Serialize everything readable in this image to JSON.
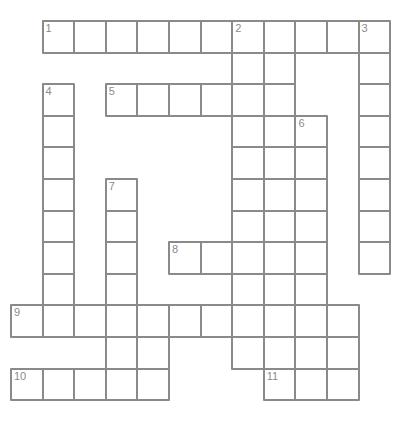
{
  "puzzle": {
    "title": "Crossword puzzle grid",
    "grid": {
      "origin_x": 10,
      "origin_y": 20,
      "cell_size": 31.6,
      "columns": 12,
      "rows": 12,
      "cell_border_color": "#8a8a8a",
      "cell_fill_color": "#ffffff",
      "number_color": "#8a8a8a",
      "background_color": "#ffffff"
    },
    "entries": [
      {
        "number": "1",
        "direction": "across",
        "row": 0,
        "col": 1,
        "length": 11
      },
      {
        "number": "2",
        "direction": "down",
        "row": 0,
        "col": 7,
        "length": 11
      },
      {
        "number": "3",
        "direction": "down",
        "row": 0,
        "col": 11,
        "length": 8
      },
      {
        "number": "4",
        "direction": "down",
        "row": 2,
        "col": 1,
        "length": 8
      },
      {
        "number": "5",
        "direction": "across",
        "row": 2,
        "col": 3,
        "length": 5
      },
      {
        "number": "6",
        "direction": "down",
        "row": 3,
        "col": 9,
        "length": 8
      },
      {
        "number": "7",
        "direction": "down",
        "row": 5,
        "col": 3,
        "length": 6
      },
      {
        "number": "8",
        "direction": "across",
        "row": 7,
        "col": 5,
        "length": 3
      },
      {
        "number": "9",
        "direction": "across",
        "row": 9,
        "col": 0,
        "length": 11
      },
      {
        "number": "10",
        "direction": "across",
        "row": 11,
        "col": 0,
        "length": 5
      },
      {
        "number": "11",
        "direction": "across",
        "row": 11,
        "col": 8,
        "length": 3
      }
    ],
    "cells": [
      {
        "row": 0,
        "col": 1,
        "number": "1",
        "letter": ""
      },
      {
        "row": 0,
        "col": 2,
        "number": "",
        "letter": ""
      },
      {
        "row": 0,
        "col": 3,
        "number": "",
        "letter": ""
      },
      {
        "row": 0,
        "col": 4,
        "number": "",
        "letter": ""
      },
      {
        "row": 0,
        "col": 5,
        "number": "",
        "letter": ""
      },
      {
        "row": 0,
        "col": 6,
        "number": "",
        "letter": ""
      },
      {
        "row": 0,
        "col": 7,
        "number": "2",
        "letter": ""
      },
      {
        "row": 0,
        "col": 8,
        "number": "",
        "letter": ""
      },
      {
        "row": 0,
        "col": 9,
        "number": "",
        "letter": ""
      },
      {
        "row": 0,
        "col": 10,
        "number": "",
        "letter": ""
      },
      {
        "row": 0,
        "col": 11,
        "number": "3",
        "letter": ""
      },
      {
        "row": 1,
        "col": 7,
        "number": "",
        "letter": ""
      },
      {
        "row": 1,
        "col": 8,
        "number": "",
        "letter": ""
      },
      {
        "row": 1,
        "col": 11,
        "number": "",
        "letter": ""
      },
      {
        "row": 2,
        "col": 1,
        "number": "4",
        "letter": ""
      },
      {
        "row": 2,
        "col": 3,
        "number": "5",
        "letter": ""
      },
      {
        "row": 2,
        "col": 4,
        "number": "",
        "letter": ""
      },
      {
        "row": 2,
        "col": 5,
        "number": "",
        "letter": ""
      },
      {
        "row": 2,
        "col": 6,
        "number": "",
        "letter": ""
      },
      {
        "row": 2,
        "col": 7,
        "number": "",
        "letter": ""
      },
      {
        "row": 2,
        "col": 8,
        "number": "",
        "letter": ""
      },
      {
        "row": 2,
        "col": 11,
        "number": "",
        "letter": ""
      },
      {
        "row": 3,
        "col": 1,
        "number": "",
        "letter": ""
      },
      {
        "row": 3,
        "col": 7,
        "number": "",
        "letter": ""
      },
      {
        "row": 3,
        "col": 8,
        "number": "",
        "letter": ""
      },
      {
        "row": 3,
        "col": 9,
        "number": "6",
        "letter": ""
      },
      {
        "row": 3,
        "col": 11,
        "number": "",
        "letter": ""
      },
      {
        "row": 4,
        "col": 1,
        "number": "",
        "letter": ""
      },
      {
        "row": 4,
        "col": 7,
        "number": "",
        "letter": ""
      },
      {
        "row": 4,
        "col": 8,
        "number": "",
        "letter": ""
      },
      {
        "row": 4,
        "col": 9,
        "number": "",
        "letter": ""
      },
      {
        "row": 4,
        "col": 11,
        "number": "",
        "letter": ""
      },
      {
        "row": 5,
        "col": 1,
        "number": "",
        "letter": ""
      },
      {
        "row": 5,
        "col": 3,
        "number": "7",
        "letter": ""
      },
      {
        "row": 5,
        "col": 7,
        "number": "",
        "letter": ""
      },
      {
        "row": 5,
        "col": 8,
        "number": "",
        "letter": ""
      },
      {
        "row": 5,
        "col": 9,
        "number": "",
        "letter": ""
      },
      {
        "row": 5,
        "col": 11,
        "number": "",
        "letter": ""
      },
      {
        "row": 6,
        "col": 1,
        "number": "",
        "letter": ""
      },
      {
        "row": 6,
        "col": 3,
        "number": "",
        "letter": ""
      },
      {
        "row": 6,
        "col": 7,
        "number": "",
        "letter": ""
      },
      {
        "row": 6,
        "col": 8,
        "number": "",
        "letter": ""
      },
      {
        "row": 6,
        "col": 9,
        "number": "",
        "letter": ""
      },
      {
        "row": 6,
        "col": 11,
        "number": "",
        "letter": ""
      },
      {
        "row": 7,
        "col": 1,
        "number": "",
        "letter": ""
      },
      {
        "row": 7,
        "col": 3,
        "number": "",
        "letter": ""
      },
      {
        "row": 7,
        "col": 5,
        "number": "8",
        "letter": ""
      },
      {
        "row": 7,
        "col": 6,
        "number": "",
        "letter": ""
      },
      {
        "row": 7,
        "col": 7,
        "number": "",
        "letter": ""
      },
      {
        "row": 7,
        "col": 8,
        "number": "",
        "letter": ""
      },
      {
        "row": 7,
        "col": 9,
        "number": "",
        "letter": ""
      },
      {
        "row": 7,
        "col": 11,
        "number": "",
        "letter": ""
      },
      {
        "row": 8,
        "col": 1,
        "number": "",
        "letter": ""
      },
      {
        "row": 8,
        "col": 3,
        "number": "",
        "letter": ""
      },
      {
        "row": 8,
        "col": 7,
        "number": "",
        "letter": ""
      },
      {
        "row": 8,
        "col": 8,
        "number": "",
        "letter": ""
      },
      {
        "row": 8,
        "col": 9,
        "number": "",
        "letter": ""
      },
      {
        "row": 9,
        "col": 0,
        "number": "9",
        "letter": ""
      },
      {
        "row": 9,
        "col": 1,
        "number": "",
        "letter": ""
      },
      {
        "row": 9,
        "col": 2,
        "number": "",
        "letter": ""
      },
      {
        "row": 9,
        "col": 3,
        "number": "",
        "letter": ""
      },
      {
        "row": 9,
        "col": 4,
        "number": "",
        "letter": ""
      },
      {
        "row": 9,
        "col": 5,
        "number": "",
        "letter": ""
      },
      {
        "row": 9,
        "col": 6,
        "number": "",
        "letter": ""
      },
      {
        "row": 9,
        "col": 7,
        "number": "",
        "letter": ""
      },
      {
        "row": 9,
        "col": 8,
        "number": "",
        "letter": ""
      },
      {
        "row": 9,
        "col": 9,
        "number": "",
        "letter": ""
      },
      {
        "row": 9,
        "col": 10,
        "number": "",
        "letter": ""
      },
      {
        "row": 10,
        "col": 3,
        "number": "",
        "letter": ""
      },
      {
        "row": 10,
        "col": 4,
        "number": "",
        "letter": ""
      },
      {
        "row": 10,
        "col": 7,
        "number": "",
        "letter": ""
      },
      {
        "row": 10,
        "col": 8,
        "number": "",
        "letter": ""
      },
      {
        "row": 10,
        "col": 9,
        "number": "",
        "letter": ""
      },
      {
        "row": 10,
        "col": 10,
        "number": "",
        "letter": ""
      },
      {
        "row": 11,
        "col": 0,
        "number": "10",
        "letter": ""
      },
      {
        "row": 11,
        "col": 1,
        "number": "",
        "letter": ""
      },
      {
        "row": 11,
        "col": 2,
        "number": "",
        "letter": ""
      },
      {
        "row": 11,
        "col": 3,
        "number": "",
        "letter": ""
      },
      {
        "row": 11,
        "col": 4,
        "number": "",
        "letter": ""
      },
      {
        "row": 11,
        "col": 8,
        "number": "11",
        "letter": ""
      },
      {
        "row": 11,
        "col": 9,
        "number": "",
        "letter": ""
      },
      {
        "row": 11,
        "col": 10,
        "number": "",
        "letter": ""
      }
    ]
  }
}
